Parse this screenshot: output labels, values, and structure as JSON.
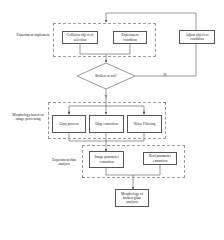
{
  "groups": {
    "implement": {
      "label": "Experiment implement"
    },
    "morphology": {
      "label": "Morphology based on image processing"
    },
    "analysis": {
      "label": "Experiment data analysis"
    }
  },
  "nodes": {
    "collision": "Collision object of selection",
    "condition": "Experiment condition",
    "adjust": "Adjust object or condition",
    "decision": "Broken or not?",
    "gray": "Gray process",
    "edge": "Edge extraction",
    "noise": "Noise Filtering",
    "image_param": "Image parameter extraction",
    "real_param": "Real parameter extraction",
    "result": "Morphology of broken glass analysis"
  },
  "edges": {
    "no_label": "N",
    "yes_label": "Y"
  },
  "colors": {
    "line": "#555555",
    "dashed_group": "#9a9a9a"
  }
}
